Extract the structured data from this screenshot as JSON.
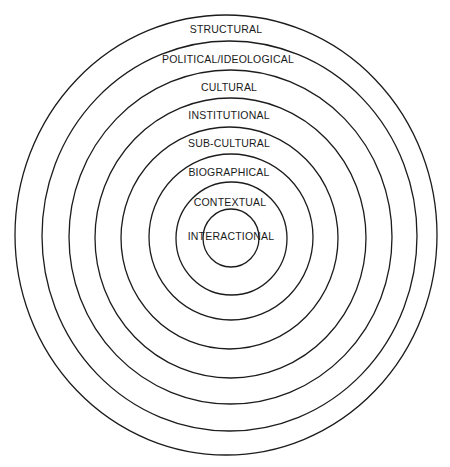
{
  "diagram": {
    "type": "concentric-circles",
    "stroke_color": "#1c1c1c",
    "background": "#ffffff",
    "layers": [
      {
        "label": "STRUCTURAL",
        "ring": {
          "cx": 226,
          "cy": 235,
          "rx": 211,
          "ry": 220
        },
        "label_pos": {
          "x": 226,
          "y": 30
        }
      },
      {
        "label": "POLITICAL/IDEOLOGICAL",
        "ring": {
          "cx": 229.5,
          "cy": 236,
          "rx": 187.5,
          "ry": 195
        },
        "label_pos": {
          "x": 228,
          "y": 60
        }
      },
      {
        "label": "CULTURAL",
        "ring": {
          "cx": 230.5,
          "cy": 237,
          "rx": 161.5,
          "ry": 167
        },
        "label_pos": {
          "x": 229,
          "y": 88
        }
      },
      {
        "label": "INSTITUTIONAL",
        "ring": {
          "cx": 230.5,
          "cy": 238,
          "rx": 135.5,
          "ry": 140
        },
        "label_pos": {
          "x": 229,
          "y": 116
        }
      },
      {
        "label": "SUB-CULTURAL",
        "ring": {
          "cx": 229.5,
          "cy": 238,
          "rx": 108.5,
          "ry": 111
        },
        "label_pos": {
          "x": 229,
          "y": 144
        }
      },
      {
        "label": "BIOGRAPHICAL",
        "ring": {
          "cx": 231,
          "cy": 237,
          "rx": 82,
          "ry": 83
        },
        "label_pos": {
          "x": 229,
          "y": 173
        }
      },
      {
        "label": "CONTEXTUAL",
        "ring": {
          "cx": 231.5,
          "cy": 238.5,
          "rx": 55.5,
          "ry": 56.5
        },
        "label_pos": {
          "x": 230,
          "y": 203
        }
      },
      {
        "label": "INTERACTIONAL",
        "ring": {
          "cx": 231,
          "cy": 238,
          "rx": 28,
          "ry": 29
        },
        "label_pos": {
          "x": 231,
          "y": 237
        }
      }
    ]
  }
}
